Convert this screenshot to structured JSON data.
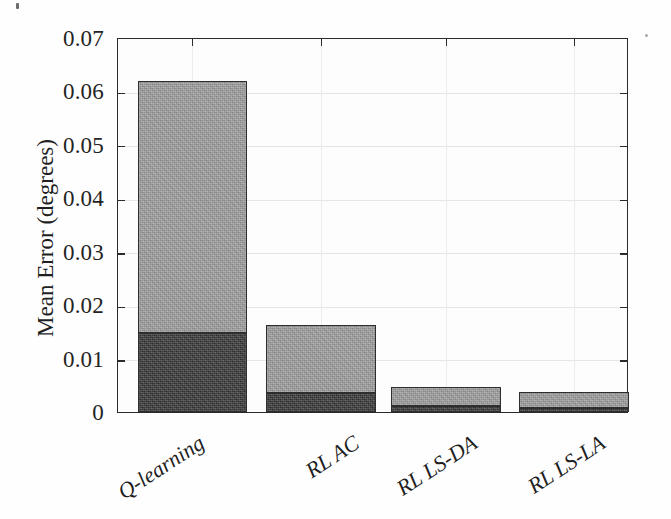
{
  "chart_data": {
    "type": "bar",
    "subtype": "stacked-vertical",
    "title": "",
    "xlabel": "",
    "ylabel": "Mean Error (degrees)",
    "ylim": [
      0,
      0.07
    ],
    "yticks": [
      "0",
      "0.01",
      "0.02",
      "0.03",
      "0.04",
      "0.05",
      "0.06",
      "0.07"
    ],
    "ytick_values": [
      0,
      0.01,
      0.02,
      0.03,
      0.04,
      0.05,
      0.06,
      0.07
    ],
    "grid": true,
    "legend": "none",
    "categories": [
      "Q-learning",
      "RL AC",
      "RL LS-DA",
      "RL LS-LA"
    ],
    "series": [
      {
        "name": "lower-segment",
        "color": "#3b3b3b",
        "values": [
          0.0148,
          0.0035,
          0.0011,
          0.0008
        ]
      },
      {
        "name": "upper-segment",
        "color": "#a2a2a2",
        "values": [
          0.0474,
          0.0128,
          0.0036,
          0.0029
        ]
      }
    ],
    "totals": [
      0.0622,
      0.0163,
      0.0047,
      0.0037
    ],
    "colors": {
      "lower_segment": "#3b3b3b",
      "upper_segment": "#a2a2a2",
      "axis": "#2b2b2b",
      "grid": "#e6e6e6",
      "background": "#fdfdfd",
      "text": "#1f1f1f"
    }
  },
  "axes": {
    "y_title": "Mean Error (degrees)",
    "y_tick_labels": [
      "0.07",
      "0.06",
      "0.05",
      "0.04",
      "0.03",
      "0.02",
      "0.01",
      "0"
    ],
    "x_tick_labels": [
      "Q-learning",
      "RL AC",
      "RL LS-DA",
      "RL LS-LA"
    ]
  }
}
